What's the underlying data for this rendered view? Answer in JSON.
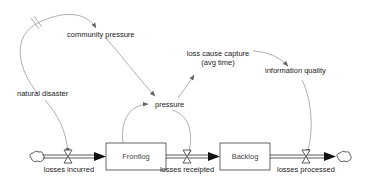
{
  "diagram": {
    "type": "stock-and-flow",
    "stocks": [
      {
        "id": "frontlog",
        "label": "Frontlog"
      },
      {
        "id": "backlog",
        "label": "Backlog"
      }
    ],
    "flows": [
      {
        "id": "losses_incurred",
        "label": "losses incurred",
        "from": "source-cloud",
        "to": "frontlog"
      },
      {
        "id": "losses_receipted",
        "label": "losses receipted",
        "from": "frontlog",
        "to": "backlog"
      },
      {
        "id": "losses_processed",
        "label": "losses processed",
        "from": "backlog",
        "to": "sink-cloud"
      }
    ],
    "variables": [
      {
        "id": "community_pressure",
        "label": "community pressure"
      },
      {
        "id": "natural_disaster",
        "label": "natural disaster"
      },
      {
        "id": "pressure",
        "label": "pressure"
      },
      {
        "id": "loss_cause_capture",
        "label": "loss cause capture",
        "label_line2": "(avg time)"
      },
      {
        "id": "information_quality",
        "label": "information quality"
      }
    ],
    "links": [
      {
        "from": "natural_disaster",
        "to": "community_pressure",
        "delay": true
      },
      {
        "from": "community_pressure",
        "to": "pressure"
      },
      {
        "from": "natural_disaster",
        "to": "losses_incurred"
      },
      {
        "from": "frontlog",
        "to": "pressure"
      },
      {
        "from": "pressure",
        "to": "losses_receipted"
      },
      {
        "from": "pressure",
        "to": "loss_cause_capture"
      },
      {
        "from": "loss_cause_capture",
        "to": "information_quality"
      },
      {
        "from": "information_quality",
        "to": "losses_processed"
      }
    ],
    "colors": {
      "link": "#9a9a9a",
      "pipe": "#333333",
      "text": "#222222"
    }
  }
}
